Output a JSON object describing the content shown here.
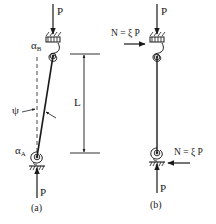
{
  "figure": {
    "stroke_color": "#1a1a1a",
    "panels": [
      {
        "id": "a",
        "caption": "(a)",
        "labels": {
          "top_load": "P",
          "bottom_load": "P",
          "spring_top": "α",
          "spring_top_sub": "B",
          "spring_bottom": "α",
          "spring_bottom_sub": "A",
          "angle": "ψ",
          "length": "L"
        }
      },
      {
        "id": "b",
        "caption": "(b)",
        "labels": {
          "top_load": "P",
          "bottom_load": "P",
          "top_lateral_force": "N = ξ P",
          "bottom_lateral_force": "N = ξ P"
        }
      }
    ]
  }
}
